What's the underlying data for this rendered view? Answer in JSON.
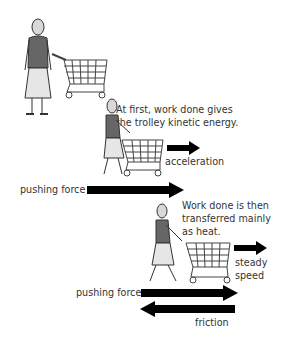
{
  "diagram": {
    "scenes": [
      {
        "id": "standing",
        "description": "Woman standing next to an empty shopping trolley"
      },
      {
        "id": "accelerating",
        "caption_line1": "At first, work done gives",
        "caption_line2": "the trolley kinetic energy.",
        "motion_label": "acceleration",
        "force_label": "pushing force"
      },
      {
        "id": "steady",
        "caption_line1": "Work done is then",
        "caption_line2": "transferred mainly",
        "caption_line3": "as heat.",
        "motion_label_line1": "steady",
        "motion_label_line2": "speed",
        "force_label": "pushing force",
        "friction_label": "friction"
      }
    ]
  }
}
